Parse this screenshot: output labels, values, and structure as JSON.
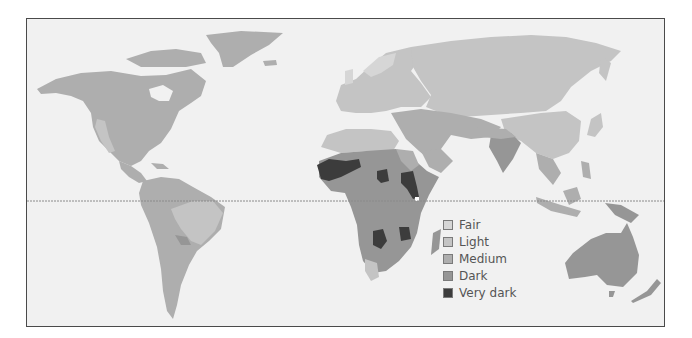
{
  "map": {
    "title": "",
    "equator_line": true,
    "colors": {
      "ocean": "#f1f1f1",
      "fair": "#d6d6d6",
      "light": "#c4c4c4",
      "medium": "#aeaeae",
      "dark": "#969696",
      "very_dark": "#3c3c3c",
      "frame": "#4a4a4a"
    },
    "legend": {
      "items": [
        {
          "label": "Fair",
          "color": "#d6d6d6"
        },
        {
          "label": "Light",
          "color": "#c4c4c4"
        },
        {
          "label": "Medium",
          "color": "#aeaeae"
        },
        {
          "label": "Dark",
          "color": "#969696"
        },
        {
          "label": "Very dark",
          "color": "#3c3c3c"
        }
      ]
    }
  }
}
